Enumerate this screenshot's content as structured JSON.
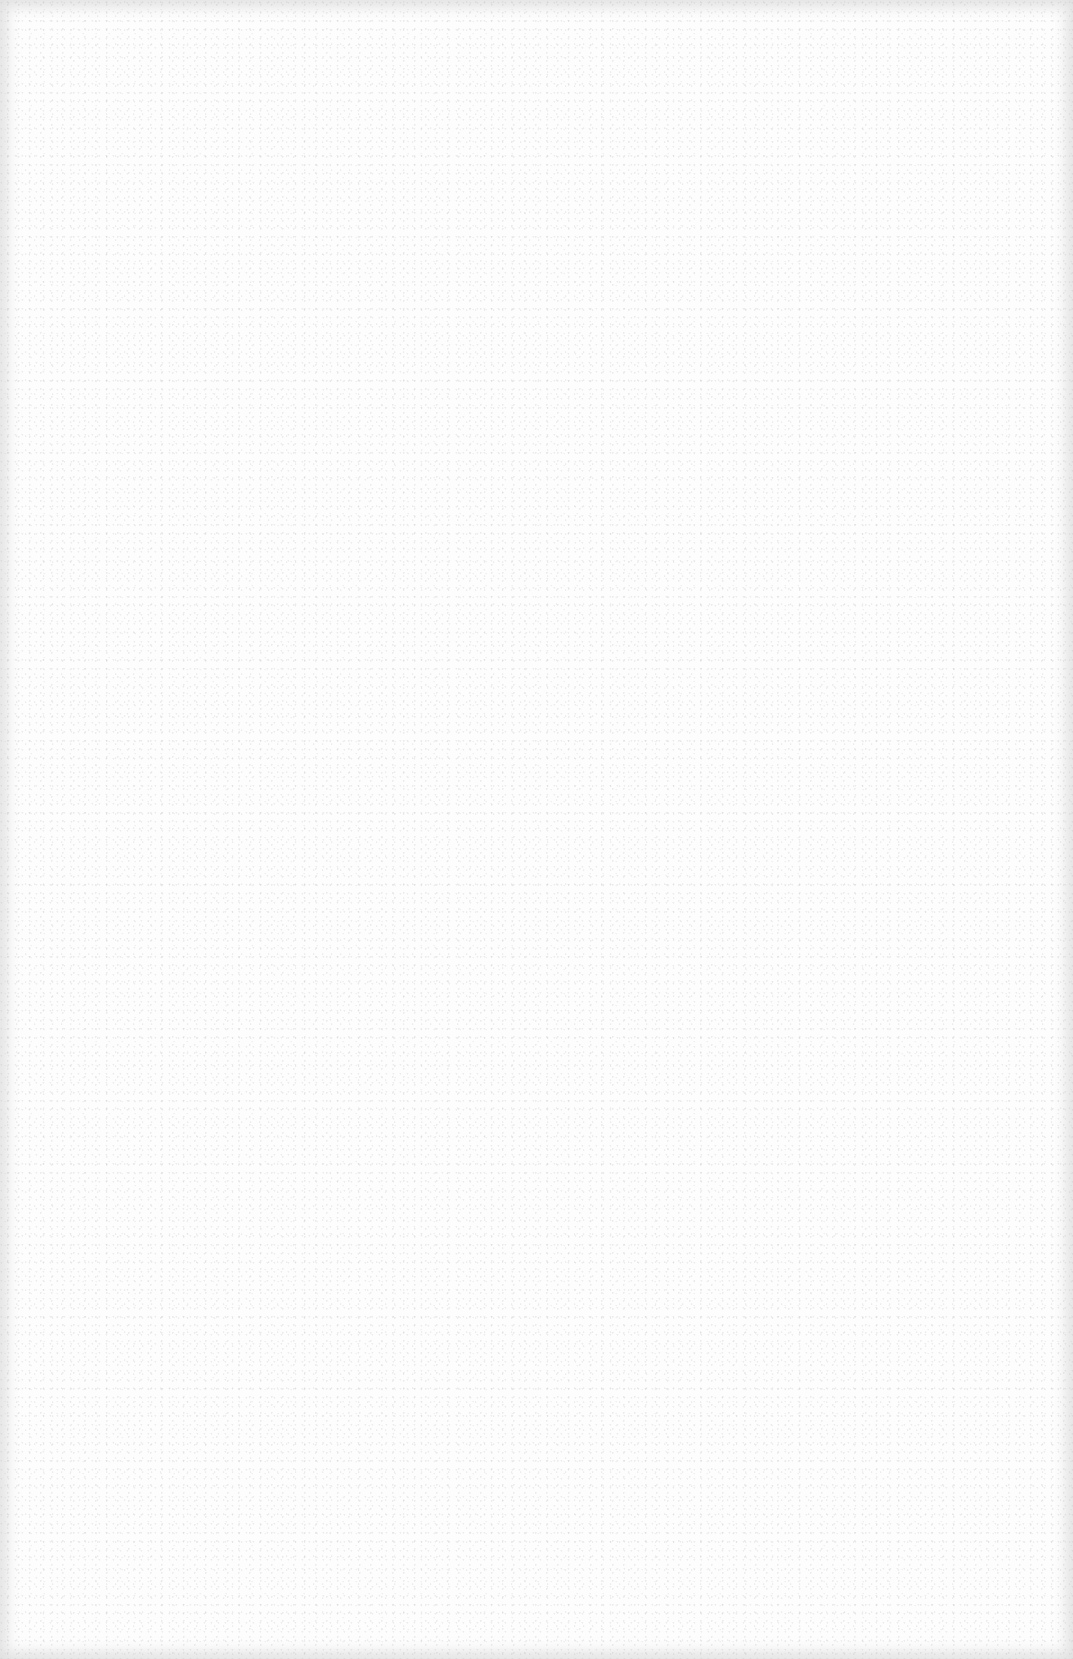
{
  "page": {
    "type": "blank-scanned-page",
    "background_color": "#fdfdfd",
    "edge_shade_color": "#e6e6e6",
    "text": ""
  }
}
